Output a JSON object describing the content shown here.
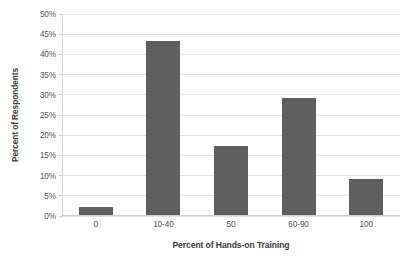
{
  "chart_data": {
    "type": "bar",
    "title": "",
    "categories": [
      "0",
      "10-40",
      "50",
      "60-90",
      "100"
    ],
    "values": [
      2,
      43,
      17,
      29,
      9
    ],
    "xlabel": "Percent of Hands-on Training",
    "ylabel": "Percent of Respondents",
    "ylim": [
      0,
      50
    ],
    "ytick_labels": [
      "0%",
      "5%",
      "10%",
      "15%",
      "20%",
      "25%",
      "30%",
      "35%",
      "40%",
      "45%",
      "50%"
    ],
    "ytick_values": [
      0,
      5,
      10,
      15,
      20,
      25,
      30,
      35,
      40,
      45,
      50
    ],
    "grid": true,
    "legend": false,
    "series": [
      {
        "name": "Percent of Respondents",
        "values": [
          2,
          43,
          17,
          29,
          9
        ],
        "color": "#5e5e5e"
      }
    ]
  },
  "style": {
    "bar_color": "#5e5e5e",
    "gridline_color": "#e2e2e2",
    "axis_color": "#d5d5d5",
    "background": "#ffffff",
    "text_color": "#555555"
  }
}
